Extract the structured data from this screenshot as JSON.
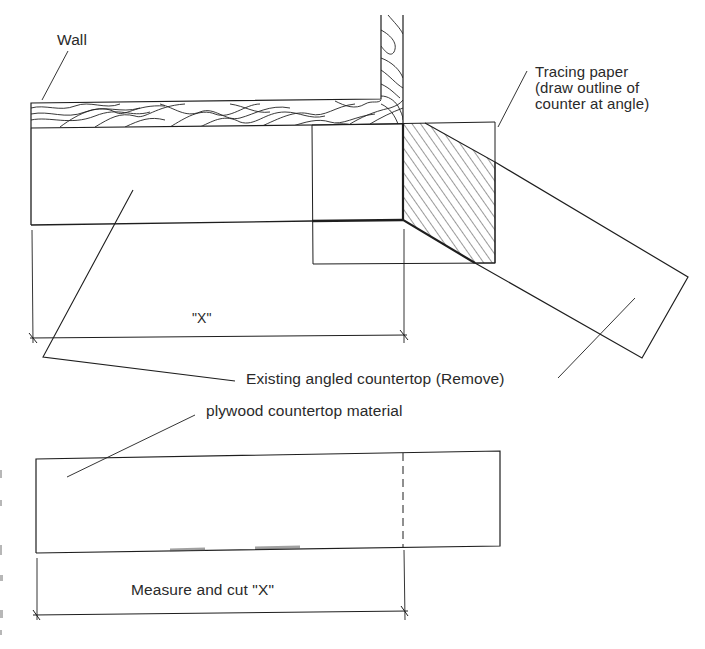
{
  "diagram": {
    "labels": {
      "wall": "Wall",
      "tracing_paper": "Tracing paper\n(draw outline of\ncounter at angle)",
      "dimension_x": "\"X\"",
      "existing_countertop": "Existing angled countertop (Remove)",
      "plywood": "plywood countertop material",
      "measure_cut": "Measure and cut \"X\""
    },
    "colors": {
      "line": "#1e1e1e",
      "text": "#2a2a2a",
      "background": "#ffffff"
    }
  }
}
